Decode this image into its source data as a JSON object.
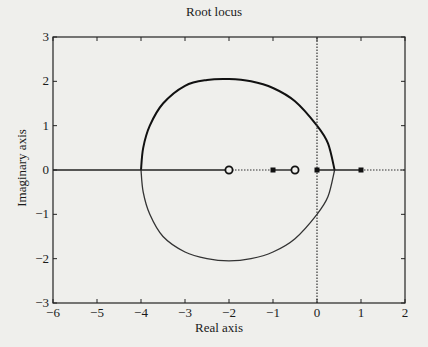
{
  "chart_data": {
    "type": "line",
    "title": "Root locus",
    "xlabel": "Real axis",
    "ylabel": "Imaginary axis",
    "xlim": [
      -6,
      2
    ],
    "ylim": [
      -3,
      3
    ],
    "xticks": [
      -6,
      -5,
      -4,
      -3,
      -2,
      -1,
      0,
      1,
      2
    ],
    "yticks": [
      -3,
      -2,
      -1,
      0,
      1,
      2,
      3
    ],
    "xtick_labels": [
      "−6",
      "−5",
      "−4",
      "−3",
      "−2",
      "−1",
      "0",
      "1",
      "2"
    ],
    "ytick_labels": [
      "−3",
      "−2",
      "−1",
      "0",
      "1",
      "2",
      "3"
    ],
    "grid": false,
    "legend": null,
    "markers": {
      "poles": [
        {
          "re": -1,
          "im": 0
        },
        {
          "re": 0,
          "im": 0
        },
        {
          "re": 1,
          "im": 0
        }
      ],
      "zeros": [
        {
          "re": -2,
          "im": 0
        },
        {
          "re": -0.5,
          "im": 0
        }
      ]
    },
    "series": [
      {
        "name": "locus-upper",
        "style": "solid-thick",
        "points": [
          [
            -4.0,
            0
          ],
          [
            -3.95,
            0.5
          ],
          [
            -3.8,
            1.0
          ],
          [
            -3.5,
            1.5
          ],
          [
            -3.0,
            1.9
          ],
          [
            -2.5,
            2.03
          ],
          [
            -2.0,
            2.05
          ],
          [
            -1.5,
            2.0
          ],
          [
            -1.0,
            1.85
          ],
          [
            -0.5,
            1.55
          ],
          [
            0.0,
            1.0
          ],
          [
            0.25,
            0.6
          ],
          [
            0.4,
            0
          ]
        ]
      },
      {
        "name": "locus-lower",
        "style": "solid-thin",
        "points": [
          [
            -4.0,
            0
          ],
          [
            -3.95,
            -0.5
          ],
          [
            -3.8,
            -1.0
          ],
          [
            -3.5,
            -1.5
          ],
          [
            -3.0,
            -1.85
          ],
          [
            -2.5,
            -2.0
          ],
          [
            -2.0,
            -2.05
          ],
          [
            -1.5,
            -2.0
          ],
          [
            -1.0,
            -1.85
          ],
          [
            -0.5,
            -1.55
          ],
          [
            0.0,
            -1.0
          ],
          [
            0.25,
            -0.6
          ],
          [
            0.4,
            0
          ]
        ]
      },
      {
        "name": "real-axis-locus",
        "style": "solid",
        "segments": [
          [
            [
              -6,
              0
            ],
            [
              -2,
              0
            ]
          ],
          [
            [
              -1,
              0
            ],
            [
              -0.5,
              0
            ]
          ],
          [
            [
              0,
              0
            ],
            [
              1,
              0
            ]
          ]
        ]
      },
      {
        "name": "real-axis-dotted",
        "style": "dotted",
        "segments": [
          [
            [
              -2,
              0
            ],
            [
              -1,
              0
            ]
          ],
          [
            [
              1,
              0
            ],
            [
              2,
              0
            ]
          ]
        ]
      },
      {
        "name": "imag-axis",
        "style": "dotted",
        "segments": [
          [
            [
              0,
              -3
            ],
            [
              0,
              3
            ]
          ]
        ]
      }
    ]
  }
}
